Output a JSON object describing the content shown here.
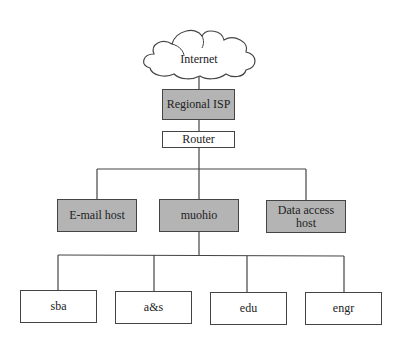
{
  "diagram": {
    "type": "network-hierarchy",
    "colors": {
      "shaded_fill": "#b4b4b4",
      "plain_fill": "#ffffff",
      "stroke": "#444444"
    },
    "cloud": {
      "label": "Internet",
      "icon": "cloud-icon"
    },
    "level1": {
      "label": "Regional ISP",
      "shaded": true
    },
    "level2": {
      "label": "Router",
      "shaded": false
    },
    "level3": [
      {
        "label": "E-mail host",
        "shaded": true
      },
      {
        "label": "muohio",
        "shaded": true
      },
      {
        "label": "Data access host",
        "label_lines": [
          "Data access",
          "host"
        ],
        "shaded": true
      }
    ],
    "level4": [
      {
        "label": "sba",
        "shaded": false
      },
      {
        "label": "a&s",
        "shaded": false
      },
      {
        "label": "edu",
        "shaded": false
      },
      {
        "label": "engr",
        "shaded": false
      }
    ],
    "edges": [
      [
        "Internet",
        "Regional ISP"
      ],
      [
        "Regional ISP",
        "Router"
      ],
      [
        "Router",
        "E-mail host"
      ],
      [
        "Router",
        "muohio"
      ],
      [
        "Router",
        "Data access host"
      ],
      [
        "muohio",
        "sba"
      ],
      [
        "muohio",
        "a&s"
      ],
      [
        "muohio",
        "edu"
      ],
      [
        "muohio",
        "engr"
      ]
    ]
  }
}
